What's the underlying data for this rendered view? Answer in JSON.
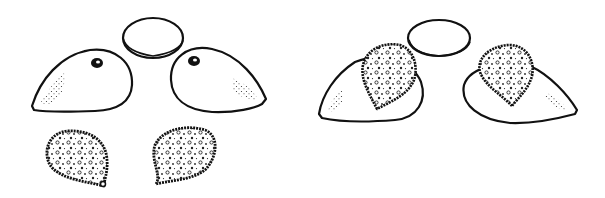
{
  "figure": {
    "title": "",
    "panels": [
      {
        "name": "left-panel",
        "parts": [
          "disc",
          "left-seed-coat-with-hilum",
          "right-seed-coat-with-hilum",
          "left-textured-seed",
          "right-textured-seed"
        ]
      },
      {
        "name": "right-panel",
        "parts": [
          "disc",
          "left-seed-coat-with-textured-seed",
          "right-seed-coat-with-textured-seed"
        ]
      }
    ],
    "colors": {
      "ink": "#111111",
      "background": "#ffffff"
    }
  }
}
